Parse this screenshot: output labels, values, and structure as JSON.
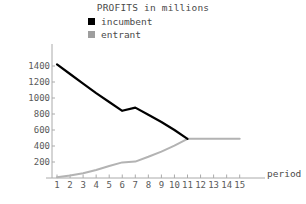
{
  "chart_data": {
    "type": "line",
    "title": "PROFITS in millions",
    "xlabel": "period",
    "ylabel": "",
    "x": [
      1,
      2,
      3,
      4,
      5,
      6,
      7,
      8,
      9,
      10,
      11,
      12,
      13,
      14,
      15
    ],
    "categories": [
      "1",
      "2",
      "3",
      "4",
      "5",
      "6",
      "7",
      "8",
      "9",
      "10",
      "11",
      "12",
      "13",
      "14",
      "15"
    ],
    "series": [
      {
        "name": "incumbent",
        "color": "#000000",
        "values": [
          1420,
          1300,
          1180,
          1060,
          950,
          840,
          880,
          790,
          700,
          600,
          490,
          null,
          null,
          null,
          null
        ]
      },
      {
        "name": "entrant",
        "color": "#b3b3b3",
        "values": [
          10,
          30,
          60,
          100,
          150,
          195,
          205,
          265,
          330,
          405,
          490,
          490,
          490,
          490,
          490
        ]
      }
    ],
    "xlim": [
      0.4,
      15.6
    ],
    "ylim": [
      0,
      1480
    ],
    "yticks": [
      200,
      400,
      600,
      800,
      1000,
      1200,
      1400
    ],
    "ytick_labels": [
      "200",
      "400",
      "600",
      "800",
      "1000",
      "1200",
      "1400"
    ],
    "grid": false,
    "legend_position": "top-center",
    "legend": [
      "incumbent",
      "entrant"
    ]
  },
  "legend": {
    "incumbent_label": "incumbent",
    "entrant_label": "entrant",
    "incumbent_swatch": "legend-swatch-black",
    "entrant_swatch": "legend-swatch-gray"
  },
  "axes": {
    "x_title": "period"
  }
}
